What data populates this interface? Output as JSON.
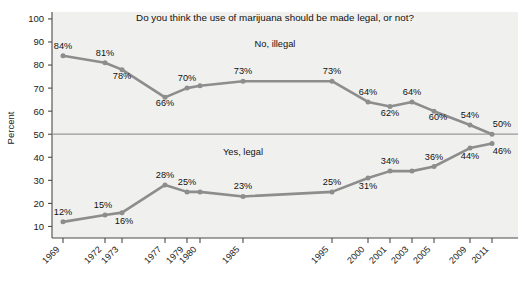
{
  "chart_data": {
    "type": "line",
    "title": "Do you think the use of marijuana should be made legal, or not?",
    "xlabel": "",
    "ylabel": "Percent",
    "ylim": [
      5,
      103
    ],
    "yticks": [
      10,
      20,
      30,
      40,
      50,
      60,
      70,
      80,
      90,
      100
    ],
    "grid": false,
    "reference_line": 50,
    "legend_position": "inline-annotation",
    "categories": [
      "1969",
      "1972",
      "1973",
      "1977",
      "1979",
      "1980",
      "1985",
      "1995",
      "2000",
      "2001",
      "2003",
      "2005",
      "2009",
      "2011"
    ],
    "series": [
      {
        "name": "No, illegal",
        "values": [
          84,
          81,
          78,
          66,
          70,
          71,
          73,
          73,
          64,
          62,
          64,
          60,
          54,
          50
        ],
        "labels": [
          "84%",
          "81%",
          "78%",
          "66%",
          "70%",
          "",
          "73%",
          "73%",
          "64%",
          "62%",
          "64%",
          "60%",
          "54%",
          "50%"
        ]
      },
      {
        "name": "Yes, legal",
        "values": [
          12,
          15,
          16,
          28,
          25,
          25,
          23,
          25,
          31,
          34,
          34,
          36,
          44,
          46
        ],
        "labels": [
          "12%",
          "15%",
          "16%",
          "28%",
          "25%",
          "",
          "23%",
          "25%",
          "31%",
          "34%",
          "",
          "36%",
          "44%",
          "46%"
        ]
      }
    ]
  },
  "series_annotations": {
    "upper": "No, illegal",
    "lower": "Yes, legal"
  },
  "colors": {
    "line": "#8d8d8d",
    "marker": "#8d8d8d",
    "plot_background": "#f0f0ee",
    "axis": "#4a4a4a",
    "reference_line": "#9a9a9a",
    "text": "#111111"
  }
}
